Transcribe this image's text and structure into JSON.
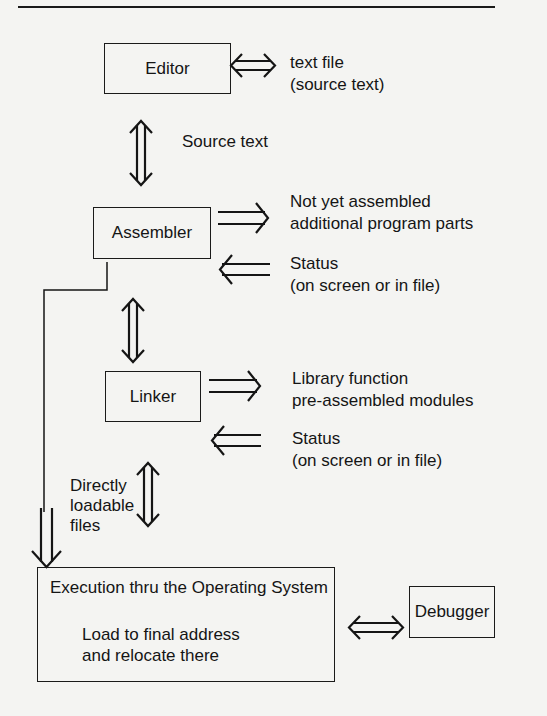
{
  "diagram": {
    "nodes": {
      "editor": "Editor",
      "assembler": "Assembler",
      "linker": "Linker",
      "execution": {
        "title": "Execution thru the Operating System",
        "line1": "Load to final address",
        "line2": "and relocate there"
      },
      "debugger": "Debugger"
    },
    "labels": {
      "editor_io": {
        "line1": "text  file",
        "line2": "(source text)"
      },
      "source_text": "Source text",
      "assembler_out": {
        "line1": "Not yet assembled",
        "line2": "additional program parts"
      },
      "assembler_status": {
        "line1": "Status",
        "line2": "(on screen or in file)"
      },
      "linker_in": {
        "line1": "Library function",
        "line2": "pre-assembled modules"
      },
      "linker_status": {
        "line1": "Status",
        "line2": "(on screen or in file)"
      },
      "directly_loadable": {
        "line1": "Directly",
        "line2": "loadable",
        "line3": "files"
      }
    },
    "edges": [
      {
        "from": "editor",
        "to": "text file",
        "type": "bidirectional"
      },
      {
        "from": "editor",
        "to": "assembler",
        "type": "bidirectional",
        "label": "Source text"
      },
      {
        "from": "assembler",
        "to": "additional program parts",
        "type": "out"
      },
      {
        "from": "status",
        "to": "assembler",
        "type": "in"
      },
      {
        "from": "assembler",
        "to": "execution",
        "type": "direct",
        "label": "Directly loadable files"
      },
      {
        "from": "assembler",
        "to": "linker",
        "type": "bidirectional"
      },
      {
        "from": "linker",
        "to": "library modules",
        "type": "out"
      },
      {
        "from": "status",
        "to": "linker",
        "type": "in"
      },
      {
        "from": "linker",
        "to": "execution",
        "type": "bidirectional"
      },
      {
        "from": "execution",
        "to": "debugger",
        "type": "bidirectional"
      }
    ]
  }
}
